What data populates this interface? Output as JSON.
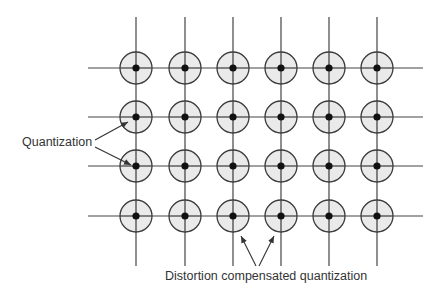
{
  "diagram": {
    "type": "lattice quantization diagram",
    "grid": {
      "columns_x": [
        136,
        185,
        233,
        281,
        329,
        377
      ],
      "rows_y": [
        68,
        117,
        166,
        216
      ],
      "vertical_line_top": 17,
      "vertical_line_bottom": 266,
      "horizontal_line_left": 88,
      "horizontal_line_right": 423,
      "circle_radius": 16,
      "dot_radius": 3.6
    },
    "colors": {
      "line": "#444444",
      "circle_fill": "#e6e6e6",
      "circle_stroke": "#3a3a3a",
      "dot": "#111111",
      "text": "#333333"
    },
    "labels": {
      "quantization": "Quantization",
      "distortion_compensated": "Distortion compensated quantization"
    },
    "arrows": {
      "quantization": [
        {
          "x1": 95,
          "y1": 140,
          "x2": 128,
          "y2": 122
        },
        {
          "x1": 95,
          "y1": 147,
          "x2": 131,
          "y2": 165
        }
      ],
      "distortion_compensated": [
        {
          "x1": 256,
          "y1": 266,
          "x2": 241,
          "y2": 236
        },
        {
          "x1": 259,
          "y1": 266,
          "x2": 274,
          "y2": 236
        }
      ]
    }
  }
}
